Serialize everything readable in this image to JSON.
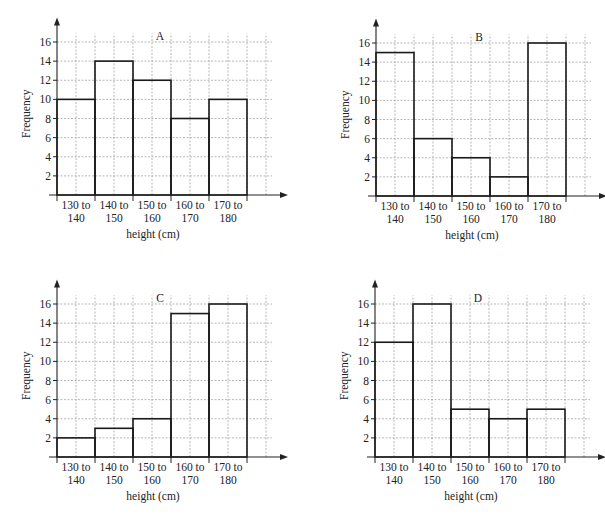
{
  "chart_data": [
    {
      "type": "bar",
      "title": "A",
      "xlabel": "height (cm)",
      "ylabel": "Frequency",
      "categories": [
        "130 to 140",
        "140 to 150",
        "150 to 160",
        "160 to 170",
        "170 to 180"
      ],
      "values": [
        10,
        14,
        12,
        8,
        10
      ],
      "yticks": [
        2,
        4,
        6,
        8,
        10,
        12,
        14,
        16
      ],
      "ylim": [
        0,
        17
      ],
      "grid": true,
      "origin": [
        57,
        195
      ]
    },
    {
      "type": "bar",
      "title": "B",
      "xlabel": "height (cm)",
      "ylabel": "Frequency",
      "categories": [
        "130 to 140",
        "140 to 150",
        "150 to 160",
        "160 to 170",
        "170 to 180"
      ],
      "values": [
        15,
        6,
        4,
        2,
        16
      ],
      "yticks": [
        2,
        4,
        6,
        8,
        10,
        12,
        14,
        16
      ],
      "ylim": [
        0,
        17
      ],
      "grid": true,
      "origin": [
        376,
        196
      ]
    },
    {
      "type": "bar",
      "title": "C",
      "xlabel": "height (cm)",
      "ylabel": "Frequency",
      "categories": [
        "130 to 140",
        "140 to 150",
        "150 to 160",
        "160 to 170",
        "170 to 180"
      ],
      "values": [
        2,
        3,
        4,
        15,
        16
      ],
      "yticks": [
        2,
        4,
        6,
        8,
        10,
        12,
        14,
        16
      ],
      "ylim": [
        0,
        17
      ],
      "grid": true,
      "origin": [
        57,
        457
      ]
    },
    {
      "type": "bar",
      "title": "D",
      "xlabel": "height (cm)",
      "ylabel": "Frequency",
      "categories": [
        "130 to 140",
        "140 to 150",
        "150 to 160",
        "160 to 170",
        "170 to 180"
      ],
      "values": [
        12,
        16,
        5,
        4,
        5
      ],
      "yticks": [
        2,
        4,
        6,
        8,
        10,
        12,
        14,
        16
      ],
      "ylim": [
        0,
        17
      ],
      "grid": true,
      "origin": [
        375,
        457
      ]
    }
  ],
  "panels": [
    {
      "title": "A",
      "xlabel": "height (cm)",
      "ylabel": "Frequency"
    },
    {
      "title": "B",
      "xlabel": "height (cm)",
      "ylabel": "Frequency"
    },
    {
      "title": "C",
      "xlabel": "height (cm)",
      "ylabel": "Frequency"
    },
    {
      "title": "D",
      "xlabel": "height (cm)",
      "ylabel": "Frequency"
    }
  ]
}
